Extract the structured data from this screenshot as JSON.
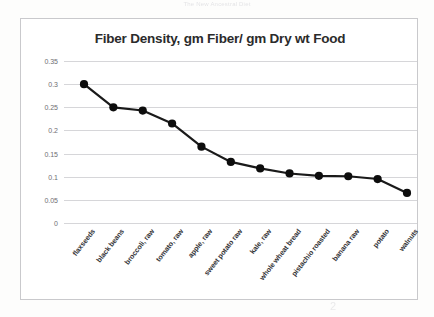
{
  "slide": {
    "header_text": "The New Ancestral Diet"
  },
  "chart_data": {
    "type": "line",
    "title": "Fiber Density, gm Fiber/ gm Dry wt Food",
    "xlabel": "",
    "ylabel": "",
    "ylim": [
      0,
      0.35
    ],
    "yticks": [
      "0.35",
      "0.3",
      "0.25",
      "0.2",
      "0.15",
      "0.1",
      "0.05",
      "0"
    ],
    "ytick_values": [
      0.35,
      0.3,
      0.25,
      0.2,
      0.15,
      0.1,
      0.05,
      0
    ],
    "grid": true,
    "legend": "none",
    "marker": "filled-circle",
    "line_color": "#1a1a1a",
    "marker_color": "#0d0d0d",
    "categories": [
      "flaxseeds",
      "black beans",
      "broccoli, raw",
      "tomato, raw",
      "apple, raw",
      "sweet potato raw",
      "kale, raw",
      "whole wheat bread",
      "pistachio roasted",
      "banana raw",
      "potato",
      "walnuts"
    ],
    "values": [
      0.3,
      0.25,
      0.243,
      0.215,
      0.165,
      0.132,
      0.118,
      0.107,
      0.102,
      0.101,
      0.095,
      0.065
    ]
  }
}
